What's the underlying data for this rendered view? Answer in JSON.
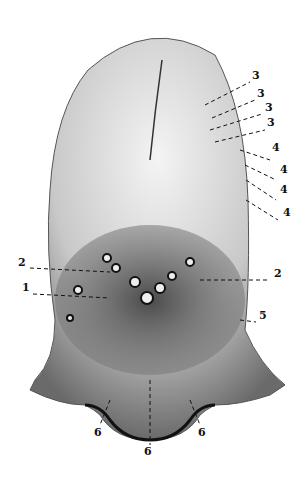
{
  "figure": {
    "colors": {
      "ink": "#111111",
      "paper": "#ffffff",
      "shade": "#555555"
    },
    "labels": [
      {
        "id": "l3a",
        "text": "3",
        "x": 252,
        "y": 78
      },
      {
        "id": "l3b",
        "text": "3",
        "x": 257,
        "y": 96
      },
      {
        "id": "l3c",
        "text": "3",
        "x": 265,
        "y": 110
      },
      {
        "id": "l3d",
        "text": "3",
        "x": 267,
        "y": 125
      },
      {
        "id": "l4a",
        "text": "4",
        "x": 272,
        "y": 150
      },
      {
        "id": "l4b",
        "text": "4",
        "x": 280,
        "y": 172
      },
      {
        "id": "l4c",
        "text": "4",
        "x": 280,
        "y": 192
      },
      {
        "id": "l4d",
        "text": "4",
        "x": 283,
        "y": 215
      },
      {
        "id": "l2L",
        "text": "2",
        "x": 18,
        "y": 265
      },
      {
        "id": "l2R",
        "text": "2",
        "x": 274,
        "y": 276
      },
      {
        "id": "l1",
        "text": "1",
        "x": 22,
        "y": 290
      },
      {
        "id": "l5",
        "text": "5",
        "x": 259,
        "y": 318
      },
      {
        "id": "l6L",
        "text": "6",
        "x": 94,
        "y": 435
      },
      {
        "id": "l6C",
        "text": "6",
        "x": 144,
        "y": 454
      },
      {
        "id": "l6R",
        "text": "6",
        "x": 198,
        "y": 435
      }
    ]
  }
}
